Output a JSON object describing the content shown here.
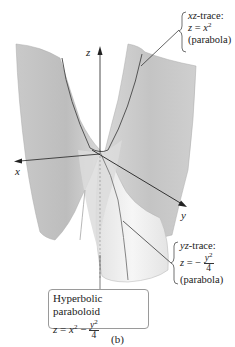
{
  "figure": {
    "caption": "(b)",
    "surface_name": "Hyperbolic paraboloid",
    "surface_equation": {
      "lhs": "z",
      "eq": "=",
      "term1": "x",
      "term1_exp": "2",
      "minus": "−",
      "frac_num": "y",
      "frac_num_exp": "2",
      "frac_den": "4"
    },
    "axes": {
      "x": "x",
      "y": "y",
      "z": "z"
    },
    "xz_trace": {
      "title": "xz-trace:",
      "eq_lhs": "z",
      "eq": "=",
      "eq_rhs": "x",
      "eq_rhs_exp": "2",
      "type": "(parabola)"
    },
    "yz_trace": {
      "title": "yz-trace:",
      "eq_lhs": "z",
      "eq": "=",
      "minus": "−",
      "frac_num": "y",
      "frac_num_exp": "2",
      "frac_den": "4",
      "type": "(parabola)"
    },
    "colors": {
      "surface_dark": "#b8b8b8",
      "surface_mid": "#d0d0d0",
      "surface_light": "#ececec",
      "trace_line": "#555555",
      "axis": "#222222"
    }
  }
}
